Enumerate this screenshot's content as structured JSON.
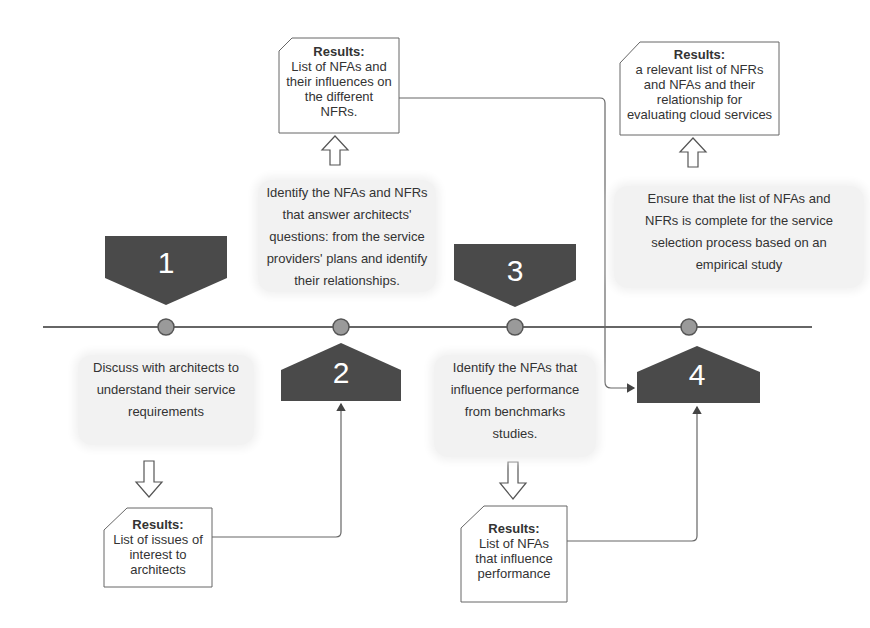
{
  "timeline": {
    "steps": [
      {
        "number": "1",
        "description": "Discuss with architects to understand their service requirements",
        "desc_lines": [
          "Discuss with architects to",
          "understand their service",
          "requirements"
        ],
        "result_title": "Results:",
        "result_lines": [
          "List of issues of",
          "interest to",
          "architects"
        ]
      },
      {
        "number": "2",
        "description": "Identify the NFAs and NFRs that answer architects' questions: from the service providers' plans and identify their relationships.",
        "desc_lines": [
          "Identify the NFAs and NFRs",
          "that answer architects'",
          "questions: from the service",
          "providers' plans and identify",
          "their relationships."
        ],
        "result_title": "Results:",
        "result_lines": [
          "List of NFAs and",
          "their influences on",
          "the different",
          "NFRs."
        ]
      },
      {
        "number": "3",
        "description": "Identify the NFAs that influence performance from benchmarks studies.",
        "desc_lines": [
          "Identify the NFAs that",
          "influence performance",
          "from benchmarks",
          "studies."
        ],
        "result_title": "Results:",
        "result_lines": [
          "List of NFAs",
          "that influence",
          "performance"
        ]
      },
      {
        "number": "4",
        "description": "Ensure that the list of NFAs and NFRs is complete for the service selection process based on an empirical study",
        "desc_lines": [
          "Ensure that the list of NFAs and",
          "NFRs is complete for the service",
          "selection process based on an",
          "empirical study"
        ],
        "result_title": "Results:",
        "result_lines": [
          "a relevant list of NFRs",
          "and NFAs and their",
          "relationship for",
          "evaluating cloud services"
        ]
      }
    ]
  },
  "colors": {
    "marker_fill": "#4a4a4a",
    "node_fill": "#9a9a9a",
    "line": "#666666",
    "desc_bg": "#f2f2f2"
  }
}
